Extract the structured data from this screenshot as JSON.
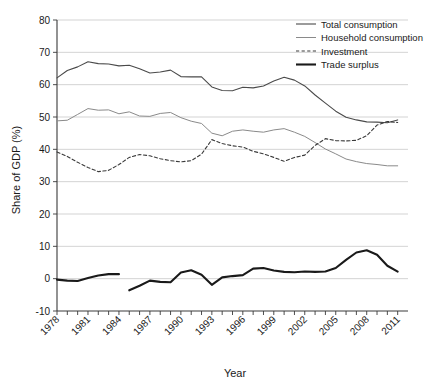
{
  "chart_data": {
    "type": "line",
    "title": "",
    "xlabel": "Year",
    "ylabel": "Share of GDP (%)",
    "xlim": [
      1978,
      2012
    ],
    "ylim": [
      -10,
      80
    ],
    "ytick_step": 10,
    "yticks": [
      -10,
      0,
      10,
      20,
      30,
      40,
      50,
      60,
      70,
      80
    ],
    "ytick_labels": [
      "-10",
      "0",
      "10",
      "20",
      "30",
      "40",
      "50",
      "60",
      "70",
      "80"
    ],
    "xticks": [
      1978,
      1979,
      1980,
      1981,
      1982,
      1983,
      1984,
      1985,
      1986,
      1987,
      1988,
      1989,
      1990,
      1991,
      1992,
      1993,
      1994,
      1995,
      1996,
      1997,
      1998,
      1999,
      2000,
      2001,
      2002,
      2003,
      2004,
      2005,
      2006,
      2007,
      2008,
      2009,
      2010,
      2011
    ],
    "xtick_labels_shown": [
      "1978",
      "1981",
      "1984",
      "1987",
      "1990",
      "1993",
      "1996",
      "1999",
      "2002",
      "2005",
      "2008",
      "2011"
    ],
    "xtick_label_rotation": -45,
    "grid": "horizontal",
    "legend_position": "top-right",
    "series": [
      {
        "name": "Total consumption",
        "style": "solid-thin",
        "color": "#4a4a4a",
        "width": 1.1,
        "x": [
          1978,
          1979,
          1980,
          1981,
          1982,
          1983,
          1984,
          1985,
          1986,
          1987,
          1988,
          1989,
          1990,
          1991,
          1992,
          1993,
          1994,
          1995,
          1996,
          1997,
          1998,
          1999,
          2000,
          2001,
          2002,
          2003,
          2004,
          2005,
          2006,
          2007,
          2008,
          2009,
          2010,
          2011
        ],
        "values": [
          62.1,
          64.4,
          65.5,
          67.1,
          66.5,
          66.4,
          65.8,
          66.0,
          64.9,
          63.6,
          63.9,
          64.5,
          62.5,
          62.4,
          62.4,
          59.3,
          58.2,
          58.1,
          59.2,
          59.0,
          59.6,
          61.1,
          62.3,
          61.4,
          59.6,
          56.8,
          54.3,
          51.8,
          49.9,
          49.1,
          48.5,
          48.4,
          48.2,
          49.1
        ]
      },
      {
        "name": "Household consumption",
        "style": "solid-thin-gray",
        "color": "#8a8a8a",
        "width": 1.0,
        "x": [
          1978,
          1979,
          1980,
          1981,
          1982,
          1983,
          1984,
          1985,
          1986,
          1987,
          1988,
          1989,
          1990,
          1991,
          1992,
          1993,
          1994,
          1995,
          1996,
          1997,
          1998,
          1999,
          2000,
          2001,
          2002,
          2003,
          2004,
          2005,
          2006,
          2007,
          2008,
          2009,
          2010,
          2011
        ],
        "values": [
          48.8,
          49.0,
          50.8,
          52.6,
          52.1,
          52.2,
          51.0,
          51.6,
          50.3,
          50.2,
          51.1,
          51.4,
          49.8,
          48.7,
          48.0,
          45.0,
          44.2,
          45.6,
          46.0,
          45.6,
          45.3,
          46.0,
          46.4,
          45.3,
          44.0,
          42.1,
          40.1,
          38.6,
          37.0,
          36.2,
          35.6,
          35.3,
          34.9,
          34.9
        ]
      },
      {
        "name": "Investment",
        "style": "dashed",
        "color": "#3a3a3a",
        "width": 1.1,
        "x": [
          1978,
          1979,
          1980,
          1981,
          1982,
          1983,
          1984,
          1985,
          1986,
          1987,
          1988,
          1989,
          1990,
          1991,
          1992,
          1993,
          1994,
          1995,
          1996,
          1997,
          1998,
          1999,
          2000,
          2001,
          2002,
          2003,
          2004,
          2005,
          2006,
          2007,
          2008,
          2009,
          2010,
          2011
        ],
        "values": [
          39.2,
          37.8,
          36.0,
          34.4,
          33.1,
          33.5,
          35.3,
          37.5,
          38.4,
          38.0,
          37.1,
          36.5,
          36.1,
          36.5,
          38.5,
          43.0,
          41.8,
          41.1,
          40.7,
          39.4,
          38.6,
          37.5,
          36.3,
          37.5,
          38.2,
          41.2,
          43.3,
          42.7,
          42.6,
          42.8,
          44.2,
          47.5,
          48.6,
          48.3
        ]
      },
      {
        "name": "Trade surplus",
        "style": "solid-thick",
        "color": "#1a1a1a",
        "width": 2.1,
        "segments": [
          {
            "x": [
              1978,
              1979,
              1980,
              1981,
              1982,
              1983,
              1984
            ],
            "values": [
              -0.3,
              -0.6,
              -0.7,
              0.2,
              1.0,
              1.4,
              1.4
            ]
          },
          {
            "x": [
              1985,
              1986,
              1987,
              1988,
              1989,
              1990,
              1991,
              1992,
              1993,
              1994,
              1995,
              1996,
              1997,
              1998,
              1999,
              2000,
              2001,
              2002,
              2003,
              2004,
              2005,
              2006,
              2007,
              2008,
              2009,
              2010,
              2011
            ],
            "values": [
              -3.6,
              -2.2,
              -0.6,
              -1.0,
              -1.1,
              1.9,
              2.6,
              1.2,
              -1.9,
              0.4,
              0.8,
              1.1,
              3.1,
              3.3,
              2.5,
              2.1,
              2.0,
              2.2,
              2.1,
              2.2,
              3.3,
              5.8,
              8.1,
              8.8,
              7.4,
              4.0,
              2.2
            ]
          }
        ]
      }
    ],
    "legend": [
      {
        "label": "Total consumption",
        "style": "solid-thin",
        "color": "#4a4a4a"
      },
      {
        "label": "Household consumption",
        "style": "solid-thin-gray",
        "color": "#8a8a8a"
      },
      {
        "label": "Investment",
        "style": "dashed",
        "color": "#3a3a3a"
      },
      {
        "label": "Trade surplus",
        "style": "solid-thick",
        "color": "#1a1a1a"
      }
    ]
  }
}
